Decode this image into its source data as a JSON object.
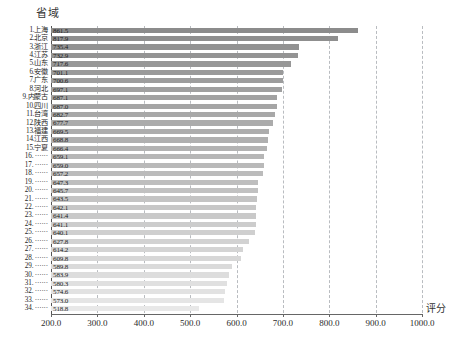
{
  "chart_data": {
    "type": "bar",
    "orientation": "horizontal",
    "title": "",
    "xlabel": "评分",
    "ylabel": "省域",
    "xlim": [
      200.0,
      1000.0
    ],
    "xticks": [
      "200.0",
      "300.0",
      "400.0",
      "500.0",
      "600.0",
      "700.0",
      "800.0",
      "900.0",
      "1000.0"
    ],
    "grid": "vertical-dashed",
    "legend": "none",
    "bar_gradient": {
      "top": "#8c8c8c",
      "bottom": "#e8e8e8"
    },
    "categories": [
      "1.上海",
      "2.北京",
      "3.浙江",
      "4.江苏",
      "5.山东",
      "6.安徽",
      "7.广东",
      "8.河北",
      "9.内蒙古",
      "10.四川",
      "11.台湾",
      "12.陕西",
      "13.福建",
      "14.江西",
      "15.宁夏",
      "16. ······",
      "17. ······",
      "18. ······",
      "19. ······",
      "20. ······",
      "21. ······",
      "22. ······",
      "23. ······",
      "24. ······",
      "25. ······",
      "26. ······",
      "27. ······",
      "28. ······",
      "29. ······",
      "30. ······",
      "31. ······",
      "32. ······",
      "33. ······",
      "34. ······"
    ],
    "values": [
      861.5,
      817.9,
      735.4,
      732.9,
      717.6,
      701.1,
      700.6,
      697.1,
      687.1,
      687.0,
      682.7,
      677.7,
      669.5,
      668.8,
      666.4,
      659.1,
      659.0,
      657.2,
      647.3,
      645.7,
      643.5,
      642.1,
      641.4,
      641.1,
      640.1,
      627.8,
      614.2,
      609.8,
      589.8,
      583.9,
      580.3,
      574.6,
      573.0,
      518.8
    ],
    "value_labels": [
      "861.5",
      "817.9",
      "735.4",
      "732.9",
      "717.6",
      "701.1",
      "700.6",
      "697.1",
      "687.1",
      "687.0",
      "682.7",
      "677.7",
      "669.5",
      "668.8",
      "666.4",
      "659.1",
      "659.0",
      "657.2",
      "647.3",
      "645.7",
      "643.5",
      "642.1",
      "641.4",
      "641.1",
      "640.1",
      "627.8",
      "614.2",
      "609.8",
      "589.8",
      "583.9",
      "580.3",
      "574.6",
      "573.0",
      "518.8"
    ]
  }
}
